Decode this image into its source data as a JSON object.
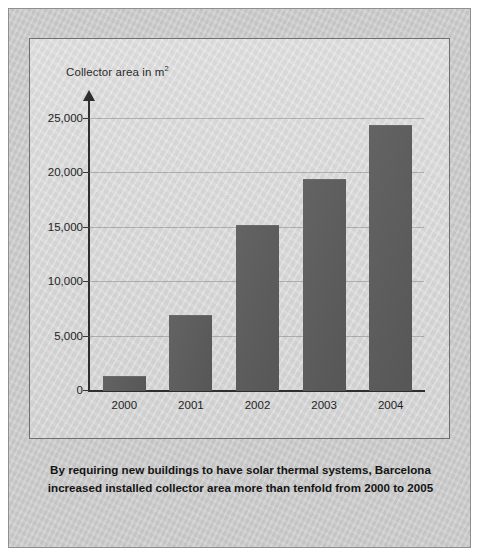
{
  "figure": {
    "caption_lines": [
      "By requiring new buildings to have solar thermal systems, Barcelona",
      "increased installed collector area more than tenfold from 2000 to 2005"
    ],
    "background_color": "#c9c9c9",
    "panel_color": "#d9d9d9",
    "bar_color": "#5b5b5b"
  },
  "chart_data": {
    "type": "bar",
    "title": "",
    "ylabel": "Collector area in m²",
    "xlabel": "",
    "categories": [
      "2000",
      "2001",
      "2002",
      "2003",
      "2004"
    ],
    "values": [
      1300,
      6900,
      15200,
      19400,
      24400
    ],
    "ylim": [
      0,
      25000
    ],
    "yticks": [
      0,
      5000,
      10000,
      15000,
      20000,
      25000
    ],
    "ytick_labels": [
      "0",
      "5,000",
      "10,000",
      "15,000",
      "20,000",
      "25,000"
    ],
    "grid": true,
    "legend": null,
    "series": [
      {
        "name": "Collector area",
        "values": [
          1300,
          6900,
          15200,
          19400,
          24400
        ]
      }
    ]
  }
}
